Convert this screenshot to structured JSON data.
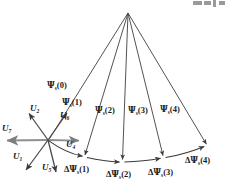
{
  "figure": {
    "type": "vector-diagram",
    "width": 231,
    "height": 192,
    "background_color": "#ffffff",
    "line_color": "#3a3a3a",
    "text_color": "#1a1a1a",
    "axis_color": "#8c8c8c"
  },
  "geometry": {
    "apex": {
      "x": 128,
      "y": 13
    },
    "star_center": {
      "x": 48,
      "y": 140
    },
    "arc_endpoints": [
      {
        "x": 48,
        "y": 140
      },
      {
        "x": 207,
        "y": 146
      }
    ],
    "flux_tips": [
      {
        "x": 48,
        "y": 140
      },
      {
        "x": 85,
        "y": 157
      },
      {
        "x": 122,
        "y": 162
      },
      {
        "x": 163,
        "y": 158
      },
      {
        "x": 207,
        "y": 146
      }
    ]
  },
  "voltage_vectors": {
    "labels": [
      {
        "id": "u1",
        "text": "U",
        "sub": "1",
        "x": 13,
        "y": 158,
        "tip": {
          "x": 26,
          "y": 170
        }
      },
      {
        "id": "u2",
        "text": "U",
        "sub": "2",
        "x": 30,
        "y": 110,
        "tip": {
          "x": 28,
          "y": 113
        }
      },
      {
        "id": "u7",
        "text": "U",
        "sub": "7",
        "x": 2,
        "y": 130,
        "tip": {
          "x": 4,
          "y": 141
        }
      },
      {
        "id": "u6",
        "text": "U",
        "sub": "6",
        "x": 61,
        "y": 118,
        "tip": {
          "x": 68,
          "y": 112
        }
      },
      {
        "id": "u4",
        "text": "U",
        "sub": "4",
        "x": 67,
        "y": 146,
        "tip": {
          "x": 81,
          "y": 141
        }
      },
      {
        "id": "u5",
        "text": "U",
        "sub": "5",
        "x": 43,
        "y": 168,
        "tip": {
          "x": 55,
          "y": 172
        }
      }
    ]
  },
  "flux_labels": [
    {
      "id": "psi0",
      "greek": "Ψ",
      "sub": "s",
      "arg": "(0)",
      "x": 49,
      "y": 88
    },
    {
      "id": "psi1",
      "greek": "Ψ",
      "sub": "s",
      "arg": "(1)",
      "x": 64,
      "y": 105
    },
    {
      "id": "psi2",
      "greek": "Ψ",
      "sub": "s",
      "arg": "(2)",
      "x": 97,
      "y": 112
    },
    {
      "id": "psi3",
      "greek": "Ψ",
      "sub": "s",
      "arg": "(3)",
      "x": 130,
      "y": 112
    },
    {
      "id": "psi4",
      "greek": "Ψ",
      "sub": "s",
      "arg": "(4)",
      "x": 162,
      "y": 111
    }
  ],
  "delta_flux_labels": [
    {
      "id": "dpsi1",
      "delta": "Δ",
      "greek": "Ψ",
      "sub": "s",
      "arg": "(1)",
      "x": 66,
      "y": 170
    },
    {
      "id": "dpsi2",
      "delta": "Δ",
      "greek": "Ψ",
      "sub": "s",
      "arg": "(2)",
      "x": 108,
      "y": 175
    },
    {
      "id": "dpsi3",
      "delta": "Δ",
      "greek": "Ψ",
      "sub": "s",
      "arg": "(3)",
      "x": 150,
      "y": 173
    },
    {
      "id": "dpsi4",
      "delta": "Δ",
      "greek": "Ψ",
      "sub": "s",
      "arg": "(4)",
      "x": 187,
      "y": 161
    }
  ]
}
